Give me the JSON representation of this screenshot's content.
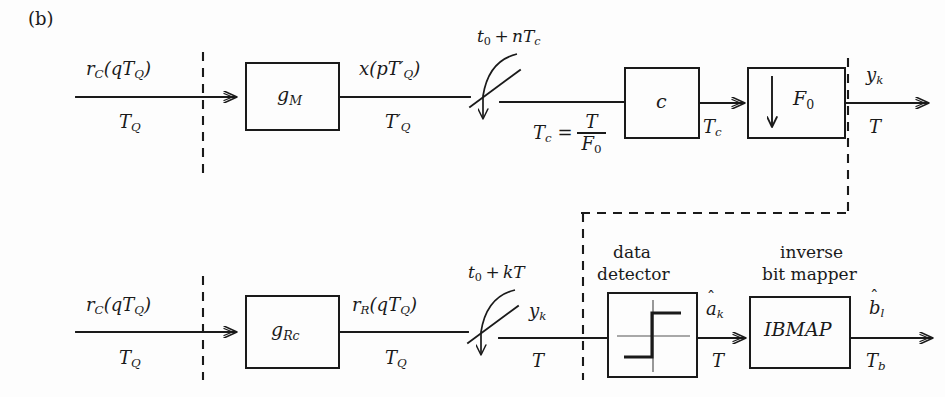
{
  "figure": {
    "part_label": "(b)"
  },
  "colors": {
    "line": "#1a1a1a",
    "background": "#fdfdfd",
    "dashed": "#1a1a1a"
  },
  "upper_row": {
    "input_signal": "r_C(qT_Q)",
    "input_rate": "T_Q",
    "block_matched_filter": "g_M",
    "signal_after_gm": "x(pT'_Q)",
    "rate_after_gm": "T'_Q",
    "switch_label": "t_0 + nT_c",
    "rate_relation_lhs": "T_c =",
    "rate_relation_num": "T",
    "rate_relation_den": "F_0",
    "block_equalizer": "c",
    "rate_after_c": "T_c",
    "block_downsampler": "F_0",
    "downsampler_icon": "down-arrow",
    "output_signal": "y_k",
    "output_rate": "T"
  },
  "lower_row": {
    "input_signal": "r_C(qT_Q)",
    "input_rate": "T_Q",
    "block_receive_filter": "g_Rc",
    "signal_after_grc": "r_R(qT_Q)",
    "rate_after_grc": "T_Q",
    "switch_label": "t_0 + kT",
    "signal_after_switch": "y_k",
    "rate_after_switch": "T",
    "detector_caption_line1": "data",
    "detector_caption_line2": "detector",
    "detector_icon": "threshold-step-icon",
    "detector_output": "a_k",
    "detector_output_hat": "^",
    "detector_output_rate": "T",
    "mapper_caption_line1": "inverse",
    "mapper_caption_line2": "bit mapper",
    "block_mapper": "IBMAP",
    "mapper_output": "b_l",
    "mapper_output_hat": "^",
    "mapper_output_rate": "T_b"
  }
}
